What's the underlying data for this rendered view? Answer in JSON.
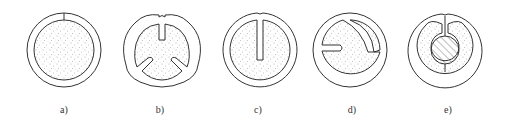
{
  "figure": {
    "panels": [
      {
        "id": "a",
        "label": "a)",
        "description": "closed ring with single radial split line, dotted core",
        "cx": 64
      },
      {
        "id": "b",
        "label": "b)",
        "description": "ring with three inward radial slots (top, lower-left, lower-right)",
        "cx": 162
      },
      {
        "id": "c",
        "label": "c)",
        "description": "ring with single long radial slot from top",
        "cx": 260
      },
      {
        "id": "d",
        "label": "d)",
        "description": "ring with horizontal slot from left and curved arc slot",
        "cx": 350
      },
      {
        "id": "e",
        "label": "e)",
        "description": "ring with top slot wrapping around hatched central circle",
        "cx": 445
      }
    ],
    "colors": {
      "stroke": "#333333",
      "stipple": "#555555",
      "background": "#ffffff"
    }
  }
}
